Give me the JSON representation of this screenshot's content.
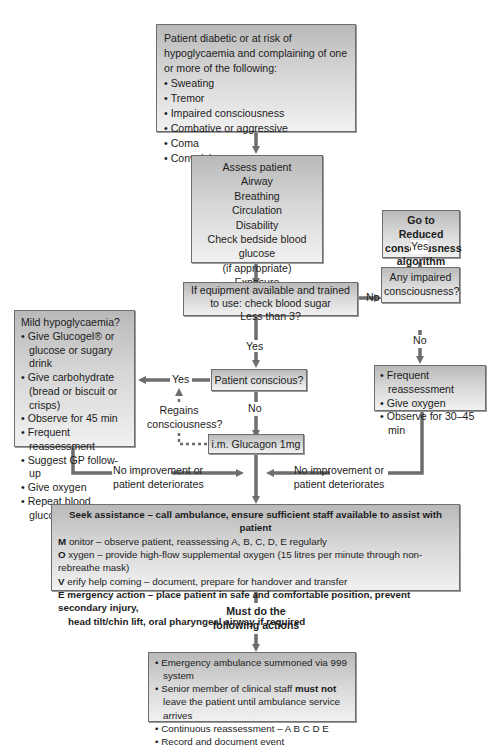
{
  "diagram": {
    "start_box": {
      "intro": "Patient diabetic or at risk of hypoglycaemia and complaining of one or more of the following:",
      "items": [
        "Sweating",
        "Tremor",
        "Impaired consciousness",
        "Combative or aggressive",
        "Coma",
        "Convulsions"
      ]
    },
    "assess_box": {
      "lines": [
        "Assess patient",
        "Airway",
        "Breathing",
        "Circulation",
        "Disability",
        "Check bedside blood glucose",
        "(if appropriate)",
        "Exposure"
      ]
    },
    "reduced_box": {
      "lines": [
        "Go to Reduced",
        "consciousness",
        "algorithm"
      ]
    },
    "equipment_box": {
      "lines": [
        "If equipment available and trained",
        "to use: check blood sugar",
        "Less than 3?"
      ]
    },
    "impaired_box": {
      "lines": [
        "Any impaired",
        "consciousness?"
      ]
    },
    "mild_box": {
      "title": "Mild hypoglycaemia?",
      "items": [
        "Give Glucogel® or glucose or sugary drink",
        "Give carbohydrate (bread or biscuit or crisps)",
        "Observe for 45 min",
        "Frequent reassessment",
        "Suggest GP follow-up",
        "Give oxygen",
        "Repeat blood glucose"
      ]
    },
    "conscious_box": {
      "label": "Patient conscious?"
    },
    "glucagon_box": {
      "label": "i.m. Glucagon 1mg"
    },
    "reassess_box": {
      "items": [
        "Frequent reassessment",
        "Give oxygen",
        "Observe for 30–45 min"
      ]
    },
    "labels": {
      "no_equipment": "No",
      "yes_reduced": "Yes",
      "no_impaired": "No",
      "yes_equipment": "Yes",
      "yes_conscious": "Yes",
      "no_conscious": "No",
      "regains_1": "Regains",
      "regains_2": "consciousness?",
      "noimp_left_1": "No improvement or",
      "noimp_left_2": "patient deteriorates",
      "noimp_right_1": "No improvement or",
      "noimp_right_2": "patient deteriorates",
      "must_1": "Must do the",
      "must_2": "following actions"
    },
    "seek_box": {
      "heading": "Seek assistance – call ambulance, ensure sufficient staff available to assist with patient",
      "m_letter": "M",
      "m_text": " onitor – observe patient, reassessing A, B, C, D, E regularly",
      "o_letter": "O",
      "o_text": " xygen – provide high-flow supplemental oxygen (15 litres per minute through non-rebreathe mask)",
      "v_letter": "V",
      "v_text": " erify help coming – document, prepare for handover and transfer",
      "e_letter": "E",
      "e_text": " mergency action – place patient in safe and comfortable position, prevent secondary injury,",
      "e_text2": "head tilt/chin lift, oral pharyngeal airway if required"
    },
    "final_box": {
      "item1": "Emergency ambulance summoned via 999 system",
      "item2_pre": "Senior member of clinical staff ",
      "item2_bold": "must not",
      "item2_post": " leave the patient until ambulance service arrives",
      "item3": "Continuous reassessment – A B C D E",
      "item4": "Record and document event"
    },
    "colors": {
      "arrow": "#6d6d6d",
      "border": "#6e6e6e",
      "box_top": "#b9b9b9",
      "box_bottom": "#f1f1f1"
    }
  }
}
